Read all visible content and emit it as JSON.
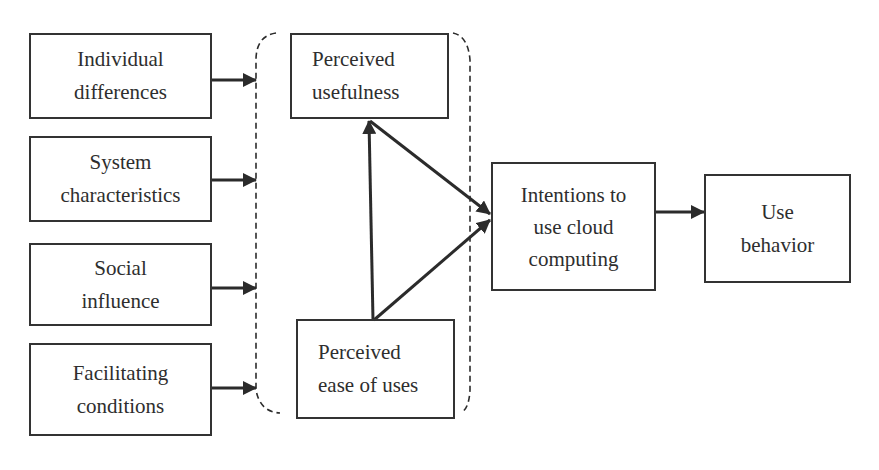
{
  "diagram": {
    "title": "",
    "colors": {
      "stroke": "#2b2b2b",
      "text": "#2e2e2e",
      "background": "#ffffff"
    },
    "nodes": {
      "individual_differences": {
        "lines": [
          "Individual",
          "differences"
        ]
      },
      "system_characteristics": {
        "lines": [
          "System",
          "characteristics"
        ]
      },
      "social_influence": {
        "lines": [
          "Social",
          "influence"
        ]
      },
      "facilitating_conditions": {
        "lines": [
          "Facilitating",
          "conditions"
        ]
      },
      "perceived_usefulness": {
        "lines": [
          "Perceived",
          "usefulness"
        ]
      },
      "perceived_ease_of_uses": {
        "lines": [
          "Perceived",
          "ease of uses"
        ]
      },
      "intentions": {
        "lines": [
          "Intentions to",
          "use cloud",
          "computing"
        ]
      },
      "use_behavior": {
        "lines": [
          "Use",
          "behavior"
        ]
      }
    },
    "group": {
      "name": "TAM constructs",
      "style": "dashed-rounded",
      "members": [
        "perceived_usefulness",
        "perceived_ease_of_uses"
      ]
    },
    "edges": [
      {
        "from": "individual_differences",
        "to": "group"
      },
      {
        "from": "system_characteristics",
        "to": "group"
      },
      {
        "from": "social_influence",
        "to": "group"
      },
      {
        "from": "facilitating_conditions",
        "to": "group"
      },
      {
        "from": "perceived_ease_of_uses",
        "to": "perceived_usefulness"
      },
      {
        "from": "perceived_usefulness",
        "to": "intentions"
      },
      {
        "from": "perceived_ease_of_uses",
        "to": "intentions"
      },
      {
        "from": "intentions",
        "to": "use_behavior"
      }
    ]
  }
}
